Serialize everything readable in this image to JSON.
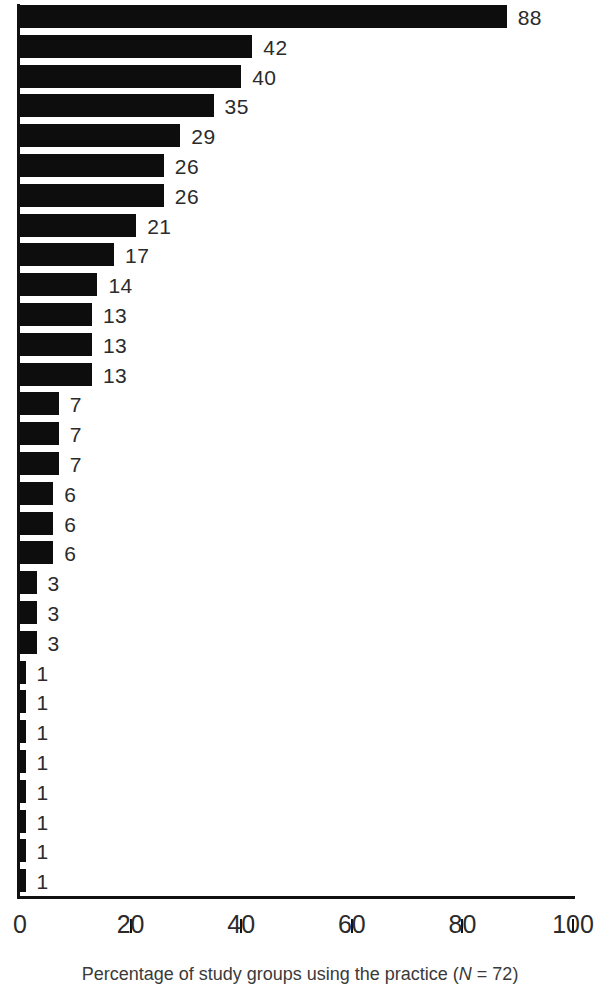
{
  "chart_data": {
    "type": "bar",
    "orientation": "horizontal",
    "title": "",
    "subtitle": "",
    "xlabel": "Percentage of study groups using the practice (N = 72)",
    "ylabel": "",
    "xlim": [
      0,
      100
    ],
    "ylim": null,
    "grid": false,
    "legend": null,
    "legend_position": "none",
    "bar_color": "#0d0d0d",
    "axis_color": "#111111",
    "background_color": "#ffffff",
    "xticks": [
      0,
      20,
      40,
      60,
      80,
      100
    ],
    "xtick_labels": [
      "0",
      "20",
      "40",
      "60",
      "80",
      "100"
    ],
    "categories": [
      "",
      "",
      "",
      "",
      "",
      "",
      "",
      "",
      "",
      "",
      "",
      "",
      "",
      "",
      "",
      "",
      "",
      "",
      "",
      "",
      "",
      "",
      "",
      "",
      "",
      "",
      "",
      "",
      "",
      ""
    ],
    "values": [
      88,
      42,
      40,
      35,
      29,
      26,
      26,
      21,
      17,
      14,
      13,
      13,
      13,
      7,
      7,
      7,
      6,
      6,
      6,
      3,
      3,
      3,
      1,
      1,
      1,
      1,
      1,
      1,
      1,
      1
    ],
    "data_labels": [
      "88",
      "42",
      "40",
      "35",
      "29",
      "26",
      "26",
      "21",
      "17",
      "14",
      "13",
      "13",
      "13",
      "7",
      "7",
      "7",
      "6",
      "6",
      "6",
      "3",
      "3",
      "3",
      "1",
      "1",
      "1",
      "1",
      "1",
      "1",
      "1",
      "1"
    ],
    "n_bars": 30,
    "sample_size": 72
  },
  "caption": {
    "text_before": "Percentage of study groups using the practice (",
    "italic_symbol": "N",
    "text_after": " = 72)"
  }
}
